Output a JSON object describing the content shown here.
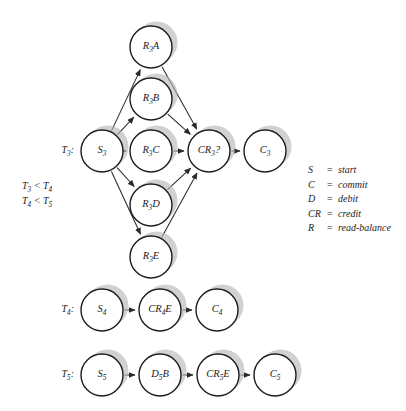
{
  "diagram": {
    "background_color": "#ffffff",
    "node_fill": "#ffffff",
    "node_stroke": "#1c1c1c",
    "shadow_color": "#b4b4b4",
    "edge_color": "#2a2a2a",
    "node_radius": 21
  },
  "transactions": [
    {
      "id": "T3",
      "row_label": {
        "base": "T",
        "sub": "3",
        "suffix": ":"
      },
      "label_x": 74,
      "label_y": 151,
      "nodes": [
        {
          "key": "S3",
          "base": "S",
          "sub": "3",
          "suffix": "",
          "x": 102,
          "y": 151
        },
        {
          "key": "R3A",
          "base": "R",
          "sub": "3",
          "suffix": "A",
          "x": 151,
          "y": 47
        },
        {
          "key": "R3B",
          "base": "R",
          "sub": "3",
          "suffix": "B",
          "x": 151,
          "y": 99
        },
        {
          "key": "R3C",
          "base": "R",
          "sub": "3",
          "suffix": "C",
          "x": 151,
          "y": 151
        },
        {
          "key": "R3D",
          "base": "R",
          "sub": "3",
          "suffix": "D",
          "x": 151,
          "y": 205
        },
        {
          "key": "R3E",
          "base": "R",
          "sub": "3",
          "suffix": "E",
          "x": 151,
          "y": 257
        },
        {
          "key": "CR3",
          "base": "CR",
          "sub": "3",
          "suffix": "?",
          "x": 209,
          "y": 151
        },
        {
          "key": "C3",
          "base": "C",
          "sub": "3",
          "suffix": "",
          "x": 265,
          "y": 151
        }
      ],
      "edges": [
        {
          "from": "S3",
          "to": "R3A"
        },
        {
          "from": "S3",
          "to": "R3B"
        },
        {
          "from": "S3",
          "to": "R3C"
        },
        {
          "from": "S3",
          "to": "R3D"
        },
        {
          "from": "S3",
          "to": "R3E"
        },
        {
          "from": "R3A",
          "to": "CR3"
        },
        {
          "from": "R3B",
          "to": "CR3"
        },
        {
          "from": "R3C",
          "to": "CR3"
        },
        {
          "from": "R3D",
          "to": "CR3"
        },
        {
          "from": "R3E",
          "to": "CR3"
        },
        {
          "from": "CR3",
          "to": "C3"
        }
      ]
    },
    {
      "id": "T4",
      "row_label": {
        "base": "T",
        "sub": "4",
        "suffix": ":"
      },
      "label_x": 74,
      "label_y": 310,
      "nodes": [
        {
          "key": "S4",
          "base": "S",
          "sub": "4",
          "suffix": "",
          "x": 102,
          "y": 310
        },
        {
          "key": "CR4E",
          "base": "CR",
          "sub": "4",
          "suffix": "E",
          "x": 160,
          "y": 310
        },
        {
          "key": "C4",
          "base": "C",
          "sub": "4",
          "suffix": "",
          "x": 217,
          "y": 310
        }
      ],
      "edges": [
        {
          "from": "S4",
          "to": "CR4E"
        },
        {
          "from": "CR4E",
          "to": "C4"
        }
      ]
    },
    {
      "id": "T5",
      "row_label": {
        "base": "T",
        "sub": "5",
        "suffix": ":"
      },
      "label_x": 74,
      "label_y": 375,
      "nodes": [
        {
          "key": "S5",
          "base": "S",
          "sub": "5",
          "suffix": "",
          "x": 102,
          "y": 375
        },
        {
          "key": "D5B",
          "base": "D",
          "sub": "5",
          "suffix": "B",
          "x": 160,
          "y": 375
        },
        {
          "key": "CR5E",
          "base": "CR",
          "sub": "5",
          "suffix": "E",
          "x": 218,
          "y": 375
        },
        {
          "key": "C5",
          "base": "C",
          "sub": "5",
          "suffix": "",
          "x": 275,
          "y": 375
        }
      ],
      "edges": [
        {
          "from": "S5",
          "to": "D5B"
        },
        {
          "from": "D5B",
          "to": "CR5E"
        },
        {
          "from": "CR5E",
          "to": "C5"
        }
      ]
    }
  ],
  "constraints": {
    "x": 22,
    "lines": [
      {
        "left_base": "T",
        "left_sub": "3",
        "op": " < ",
        "right_base": "T",
        "right_sub": "4",
        "y": 187
      },
      {
        "left_base": "T",
        "left_sub": "4",
        "op": " < ",
        "right_base": "T",
        "right_sub": "5",
        "y": 202
      }
    ]
  },
  "legend": {
    "symbol_x": 308,
    "equals_x": 327,
    "desc_x": 338,
    "start_y": 171,
    "line_height": 14.5,
    "entries": [
      {
        "symbol": "S",
        "equals": "=",
        "description": "start"
      },
      {
        "symbol": "C",
        "equals": "=",
        "description": "commit"
      },
      {
        "symbol": "D",
        "equals": "=",
        "description": "debit"
      },
      {
        "symbol": "CR",
        "equals": "=",
        "description": "credit"
      },
      {
        "symbol": "R",
        "equals": "=",
        "description": "read-balance"
      }
    ]
  }
}
